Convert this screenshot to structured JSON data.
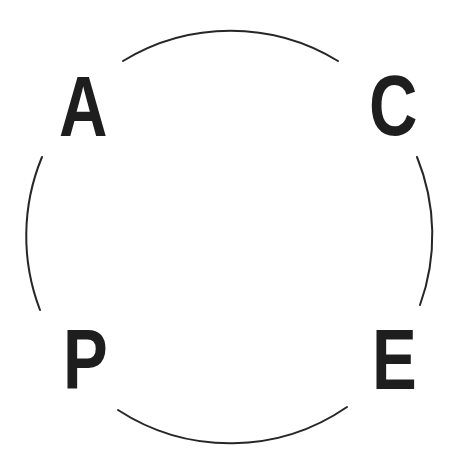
{
  "diagram": {
    "type": "cycle",
    "shape": "circle-with-four-arcs",
    "stroke_color": "#262626",
    "letter_color": "#1e1e1e",
    "background": "#ffffff",
    "nodes": [
      {
        "position": "top-left",
        "label": "A"
      },
      {
        "position": "top-right",
        "label": "C"
      },
      {
        "position": "bottom-left",
        "label": "P"
      },
      {
        "position": "bottom-right",
        "label": "E"
      }
    ],
    "arcs": [
      {
        "name": "top",
        "from": "A",
        "to": "C"
      },
      {
        "name": "right",
        "from": "C",
        "to": "E"
      },
      {
        "name": "bottom",
        "from": "E",
        "to": "P"
      },
      {
        "name": "left",
        "from": "P",
        "to": "A"
      }
    ]
  }
}
